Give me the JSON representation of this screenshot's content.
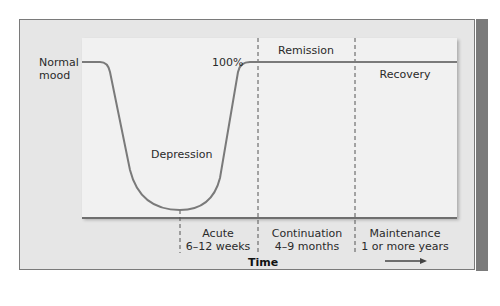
{
  "diagram": {
    "labels": {
      "normal_mood_line1": "Normal",
      "normal_mood_line2": "mood",
      "hundred_percent": "100%",
      "remission": "Remission",
      "recovery": "Recovery",
      "depression": "Depression"
    },
    "phases": [
      {
        "name": "Acute",
        "duration": "6–12 weeks"
      },
      {
        "name": "Continuation",
        "duration": "4–9 months"
      },
      {
        "name": "Maintenance",
        "duration": "1 or more years"
      }
    ],
    "x_axis_label": "Time",
    "arrow": "time-arrow",
    "colors": {
      "curve": "#7a7a7a",
      "frame_bg": "#e6e6e6",
      "panel_bg": "#f1f1f1",
      "side_strip": "#7b7b7b",
      "dashed": "#555555"
    }
  }
}
